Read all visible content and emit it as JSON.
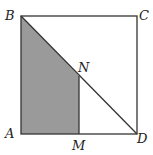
{
  "diagram": {
    "colors": {
      "stroke": "#333333",
      "shade": "#9a9a9a",
      "background": "#ffffff"
    },
    "labels": {
      "A": "A",
      "B": "B",
      "C": "C",
      "D": "D",
      "M": "M",
      "N": "N"
    },
    "points": {
      "A": [
        21,
        134
      ],
      "B": [
        21,
        16
      ],
      "C": [
        137,
        16
      ],
      "D": [
        137,
        134
      ],
      "M": [
        79,
        134
      ],
      "N": [
        79,
        76
      ]
    },
    "shaded_region": [
      "B",
      "N",
      "M",
      "A"
    ],
    "segments": [
      [
        "A",
        "B"
      ],
      [
        "B",
        "C"
      ],
      [
        "C",
        "D"
      ],
      [
        "D",
        "A"
      ],
      [
        "B",
        "D"
      ],
      [
        "M",
        "N"
      ]
    ]
  }
}
